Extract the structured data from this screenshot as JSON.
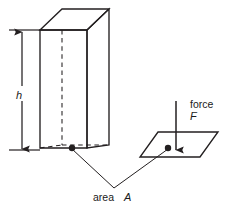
{
  "figure": {
    "stroke_color": "#231f20",
    "background_color": "#ffffff",
    "labels": {
      "height": "h",
      "force": "force",
      "force_symbol": "F",
      "area": "area",
      "area_symbol": "A"
    },
    "shapes": {
      "prism": {
        "name": "rectangular-prism",
        "hidden_edges": "dashed",
        "front_face_left_x": 40,
        "front_face_right_x": 87,
        "top_y": 30,
        "bottom_y": 148
      },
      "base_area_plane": {
        "name": "area-parallelogram",
        "left_x": 140,
        "right_x": 218,
        "top_y": 132,
        "bottom_y": 157
      },
      "dimension_arrow": {
        "name": "height-dimension",
        "orientation": "vertical",
        "double_headed": true,
        "x": 22,
        "top_y": 31,
        "bottom_y": 150
      },
      "force_arrow": {
        "name": "force-vector",
        "orientation": "vertical-down",
        "x": 176,
        "top_y": 101,
        "bottom_y": 151
      },
      "markers": [
        {
          "name": "prism-base-point",
          "cx": 72,
          "cy": 148
        },
        {
          "name": "plane-area-point",
          "cx": 168,
          "cy": 148
        }
      ],
      "leader_lines": [
        {
          "name": "leader-to-prism-base",
          "from_x": 72,
          "from_y": 149,
          "to_x": 114,
          "to_y": 188
        },
        {
          "name": "leader-to-plane-area",
          "from_x": 168,
          "from_y": 149,
          "to_x": 114,
          "to_y": 188
        }
      ]
    }
  }
}
